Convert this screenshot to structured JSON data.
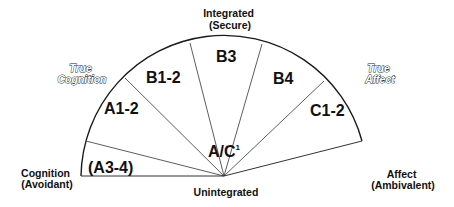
{
  "diagram": {
    "type": "semicircular-segment-model",
    "poles": {
      "top": {
        "line1": "Integrated",
        "line2": "(Secure)"
      },
      "bottom": {
        "label": "Unintegrated"
      },
      "left": {
        "line1": "Cognition",
        "line2": "(Avoidant)"
      },
      "right": {
        "line1": "Affect",
        "line2": "(Ambivalent)"
      }
    },
    "axes_labels": {
      "true_cognition": {
        "line1": "True",
        "line2": "Cognition"
      },
      "true_affect": {
        "line1": "True",
        "line2": "Affect"
      }
    },
    "segments": [
      {
        "id": "a3-4",
        "label": "(A3-4)"
      },
      {
        "id": "a1-2",
        "label": "A1-2"
      },
      {
        "id": "b1-2",
        "label": "B1-2"
      },
      {
        "id": "b3",
        "label": "B3"
      },
      {
        "id": "b4",
        "label": "B4"
      },
      {
        "id": "c1-2",
        "label": "C1-2"
      }
    ],
    "center": {
      "label": "A/C",
      "superscript": "1"
    },
    "colors": {
      "line": "#1a1a1a",
      "text": "#111111",
      "background": "#ffffff"
    }
  }
}
